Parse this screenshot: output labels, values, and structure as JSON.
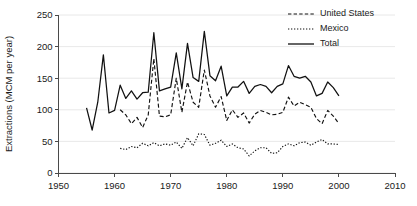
{
  "chart_data": {
    "type": "line",
    "title": "",
    "xlabel": "",
    "ylabel": "Extractions (MCM per year)",
    "xlim": [
      1950,
      2010
    ],
    "ylim": [
      0,
      250
    ],
    "xticks": [
      1950,
      1960,
      1970,
      1980,
      1990,
      2000,
      2010
    ],
    "yticks": [
      0,
      50,
      100,
      150,
      200,
      250
    ],
    "grid": "horizontal",
    "legend_position": "top-right",
    "legend": [
      "United States",
      "Mexico",
      "Total"
    ],
    "series": [
      {
        "name": "United States",
        "style": "dashed",
        "x": [
          1961,
          1962,
          1963,
          1964,
          1965,
          1966,
          1967,
          1968,
          1969,
          1970,
          1971,
          1972,
          1973,
          1974,
          1975,
          1976,
          1977,
          1978,
          1979,
          1980,
          1981,
          1982,
          1983,
          1984,
          1985,
          1986,
          1987,
          1988,
          1989,
          1990,
          1991,
          1992,
          1993,
          1994,
          1995,
          1996,
          1997,
          1998,
          1999,
          2000
        ],
        "values": [
          100,
          92,
          78,
          88,
          72,
          92,
          181,
          90,
          89,
          92,
          150,
          96,
          144,
          112,
          104,
          163,
          122,
          104,
          121,
          83,
          100,
          88,
          95,
          79,
          93,
          99,
          96,
          92,
          93,
          96,
          120,
          106,
          112,
          108,
          104,
          86,
          78,
          99,
          90,
          78
        ]
      },
      {
        "name": "Mexico",
        "style": "dotted",
        "x": [
          1961,
          1962,
          1963,
          1964,
          1965,
          1966,
          1967,
          1968,
          1969,
          1970,
          1971,
          1972,
          1973,
          1974,
          1975,
          1976,
          1977,
          1978,
          1979,
          1980,
          1981,
          1982,
          1983,
          1984,
          1985,
          1986,
          1987,
          1988,
          1989,
          1990,
          1991,
          1992,
          1993,
          1994,
          1995,
          1996,
          1997,
          1998,
          1999,
          2000
        ],
        "values": [
          39,
          37,
          42,
          40,
          47,
          43,
          48,
          43,
          46,
          44,
          49,
          39,
          56,
          43,
          62,
          61,
          44,
          47,
          52,
          42,
          46,
          40,
          38,
          27,
          35,
          40,
          40,
          31,
          32,
          42,
          46,
          43,
          48,
          49,
          44,
          49,
          53,
          46,
          46,
          45
        ]
      },
      {
        "name": "Total",
        "style": "solid",
        "x": [
          1955,
          1956,
          1957,
          1958,
          1959,
          1960,
          1961,
          1962,
          1963,
          1964,
          1965,
          1966,
          1967,
          1968,
          1969,
          1970,
          1971,
          1972,
          1973,
          1974,
          1975,
          1976,
          1977,
          1978,
          1979,
          1980,
          1981,
          1982,
          1983,
          1984,
          1985,
          1986,
          1987,
          1988,
          1989,
          1990,
          1991,
          1992,
          1993,
          1994,
          1995,
          1996,
          1997,
          1998,
          1999,
          2000
        ],
        "values": [
          103,
          68,
          112,
          187,
          95,
          99,
          139,
          118,
          130,
          117,
          127,
          128,
          222,
          130,
          133,
          136,
          190,
          133,
          205,
          151,
          145,
          224,
          154,
          146,
          169,
          122,
          136,
          136,
          145,
          126,
          137,
          140,
          137,
          127,
          137,
          141,
          170,
          153,
          150,
          153,
          144,
          122,
          126,
          144,
          135,
          122
        ]
      }
    ]
  },
  "axes": {
    "y_tick_labels": [
      "0",
      "50",
      "100",
      "150",
      "200",
      "250"
    ],
    "x_tick_labels": [
      "1950",
      "1960",
      "1970",
      "1980",
      "1990",
      "2000",
      "2010"
    ],
    "y_axis_title": "Extractions (MCM per year)"
  },
  "colors": {
    "line": "#111111",
    "grid": "#e2e2e2",
    "axis": "#4a4a4a",
    "background": "#ffffff"
  }
}
